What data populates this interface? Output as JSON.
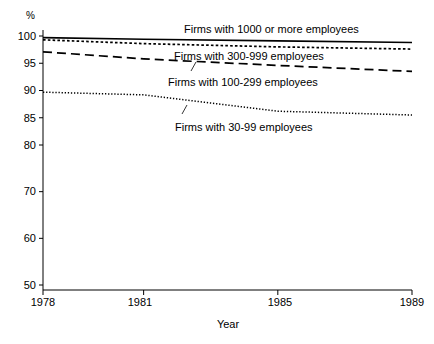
{
  "figure": {
    "y_axis_unit_label": "%",
    "x_axis_title": "Year",
    "y_ticks": [
      "100",
      "95",
      "90",
      "85",
      "80",
      "70",
      "60",
      "50"
    ],
    "x_ticks": [
      "1978",
      "1981",
      "1985",
      "1989"
    ]
  },
  "chart_data": {
    "type": "line",
    "title": "",
    "subtitle": "",
    "xlabel": "Year",
    "ylabel": "%",
    "xlim": [
      1978,
      1989
    ],
    "ylim": [
      50,
      100
    ],
    "grid": false,
    "legend_position": "inline-annotations",
    "y_axis_note": "Axis compressed below 80: ticks every 5 units from 80 to 100, every 10 units from 50 to 80",
    "x": [
      1978,
      1981,
      1985,
      1989
    ],
    "series": [
      {
        "name": "Firms with 1000 or more employees",
        "style": "solid",
        "values": [
          99.7,
          99.4,
          99.1,
          98.8
        ]
      },
      {
        "name": "Firms with 300-999 employees",
        "style": "fine-dotted",
        "values": [
          99.3,
          98.6,
          98.0,
          97.6
        ]
      },
      {
        "name": "Firms with 100-299 employees",
        "style": "dashed",
        "values": [
          97.1,
          95.8,
          94.6,
          93.5
        ]
      },
      {
        "name": "Firms with 30-99 employees",
        "style": "dotted",
        "values": [
          89.7,
          89.2,
          86.2,
          85.5
        ]
      }
    ],
    "annotations": [
      {
        "text": "Firms with 1000 or more employees",
        "x": 1984.0,
        "y": 100.6
      },
      {
        "text": "Firms with 300-999 employees",
        "x": 1983.6,
        "y": 96.9
      },
      {
        "text": "Firms with 100-299 employees",
        "x": 1983.2,
        "y": 92.6
      },
      {
        "text": "Firms with 30-99 employees",
        "x": 1983.0,
        "y": 82.9
      }
    ]
  }
}
